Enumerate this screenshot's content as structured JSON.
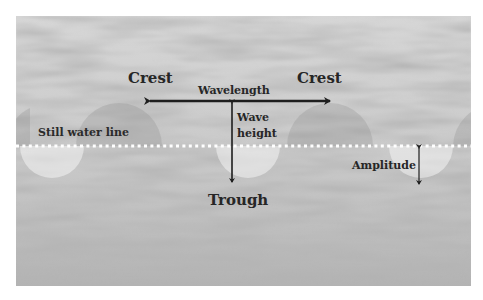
{
  "diagram": {
    "type": "wave-anatomy",
    "labels": {
      "crest_left": "Crest",
      "crest_right": "Crest",
      "wavelength": "Wavelength",
      "wave_height_line1": "Wave",
      "wave_height_line2": "height",
      "still_water_line": "Still water line",
      "trough": "Trough",
      "amplitude": "Amplitude"
    },
    "colors": {
      "arrow": "#1e1e1e",
      "dotted_line": "#ffffff",
      "crest_fill": "#9a9a9a",
      "trough_fill": "#f2f2f2",
      "background": "#ffffff"
    }
  }
}
